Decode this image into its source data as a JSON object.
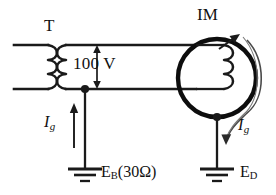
{
  "diagram": {
    "title_transformer": "T",
    "title_motor": "IM",
    "voltage_label": "100 V",
    "current_left": "I",
    "current_left_sub": "g",
    "current_right": "I",
    "current_right_sub": "g",
    "ground_left_main": "E",
    "ground_left_sub": "B",
    "ground_left_paren": "(30Ω)",
    "ground_right_main": "E",
    "ground_right_sub": "D",
    "colors": {
      "line": "#1a1a1a",
      "motor_circle": "#0d0d0d",
      "background": "#ffffff",
      "text": "#111111"
    }
  }
}
